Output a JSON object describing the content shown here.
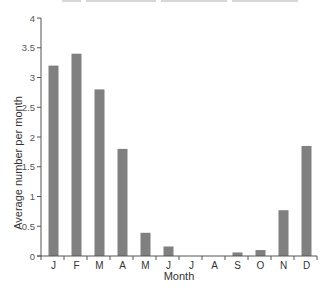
{
  "chart_data": {
    "type": "bar",
    "title": "",
    "xlabel": "Month",
    "ylabel": "Average number per month",
    "categories": [
      "J",
      "F",
      "M",
      "A",
      "M",
      "J",
      "J",
      "A",
      "S",
      "O",
      "N",
      "D"
    ],
    "values": [
      3.2,
      3.4,
      2.8,
      1.8,
      0.39,
      0.16,
      0,
      0,
      0.06,
      0.1,
      0.77,
      1.85
    ],
    "ylim": [
      0,
      4
    ],
    "yticks": [
      "0",
      "0.5",
      "1",
      "1.5",
      "2",
      "2.5",
      "3",
      "3.5",
      "4"
    ],
    "grid": false,
    "legend": null,
    "bar_color": "#808080"
  }
}
